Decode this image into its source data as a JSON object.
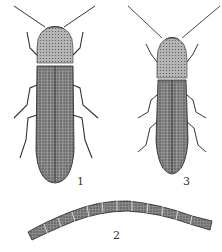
{
  "figure": {
    "specimens": [
      {
        "id": "1",
        "label": "1",
        "type": "adult click beetle (larger)"
      },
      {
        "id": "2",
        "label": "2",
        "type": "larva (wireworm)"
      },
      {
        "id": "3",
        "label": "3",
        "type": "adult click beetle (smaller)"
      }
    ],
    "colors": {
      "background": "#ffffff",
      "ink": "#2a2a2a",
      "shade": "#6b6b6b"
    }
  }
}
